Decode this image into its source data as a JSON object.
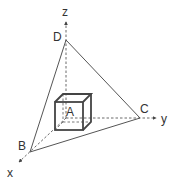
{
  "diagram": {
    "type": "3d-coordinate-tetrahedron",
    "axes": [
      {
        "id": "x",
        "label": "x"
      },
      {
        "id": "y",
        "label": "y"
      },
      {
        "id": "z",
        "label": "z"
      }
    ],
    "points": [
      {
        "id": "A",
        "label": "A",
        "description": "cube"
      },
      {
        "id": "B",
        "label": "B",
        "on_axis": "x"
      },
      {
        "id": "C",
        "label": "C",
        "on_axis": "y"
      },
      {
        "id": "D",
        "label": "D",
        "on_axis": "z"
      }
    ],
    "edges": [
      [
        "B",
        "C"
      ],
      [
        "C",
        "D"
      ],
      [
        "D",
        "B"
      ]
    ],
    "colors": {
      "line": "#555555",
      "text": "#333333",
      "background": "#ffffff"
    }
  }
}
